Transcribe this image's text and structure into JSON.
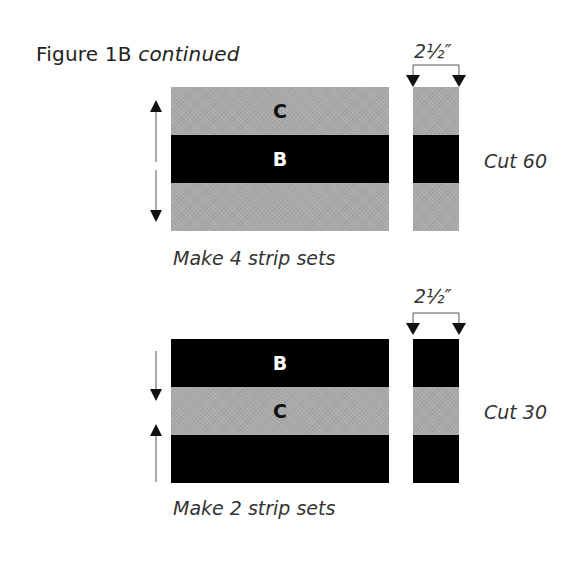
{
  "figure": {
    "title": "Figure 1B",
    "title_suffix": "continued"
  },
  "diagrams": [
    {
      "strip_set": {
        "bands": [
          {
            "label": "C",
            "color": "gray"
          },
          {
            "label": "B",
            "color": "black"
          },
          {
            "label": "",
            "color": "gray"
          }
        ],
        "press_arrows": [
          "up",
          "down"
        ]
      },
      "cut_piece": {
        "width_label": "2½″",
        "bands": [
          "gray",
          "black",
          "gray"
        ]
      },
      "cut_label": "Cut 60",
      "caption": "Make 4 strip sets"
    },
    {
      "strip_set": {
        "bands": [
          {
            "label": "B",
            "color": "black"
          },
          {
            "label": "C",
            "color": "gray"
          },
          {
            "label": "",
            "color": "black"
          }
        ],
        "press_arrows": [
          "down",
          "up"
        ]
      },
      "cut_piece": {
        "width_label": "2½″",
        "bands": [
          "black",
          "gray",
          "black"
        ]
      },
      "cut_label": "Cut 30",
      "caption": "Make 2 strip sets"
    }
  ],
  "colors": {
    "gray": "#a9a9a9",
    "black": "#000000"
  }
}
